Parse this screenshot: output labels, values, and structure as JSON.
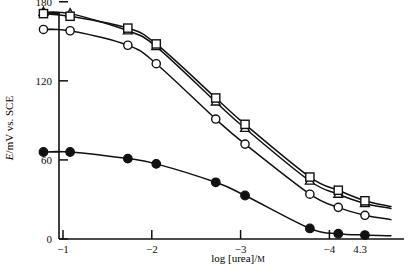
{
  "chart_data": {
    "type": "line",
    "title": "",
    "xlabel": "log [urea]/M",
    "ylabel": "E/mV vs. SCE",
    "xlim": [
      -0.65,
      -4.62
    ],
    "ylim": [
      0,
      195
    ],
    "grid": false,
    "legend": "none",
    "x_ticks": [
      "-1",
      "-2",
      "-3",
      "-4"
    ],
    "x_tick_values": [
      -1,
      -2,
      -3,
      -4
    ],
    "x_extra_tick_label": "4.3",
    "x_extra_tick_value": -4.3,
    "y_ticks": [
      "0",
      "60",
      "120",
      "180"
    ],
    "y_tick_values": [
      0,
      60,
      120,
      180
    ],
    "series": [
      {
        "name": "series-triangles",
        "marker": "open-triangle",
        "x": [
          -0.78,
          -1.08,
          -1.73,
          -2.05,
          -2.72,
          -3.05,
          -3.78,
          -4.1,
          -4.4
        ],
        "y": [
          172,
          171,
          158,
          146,
          104,
          84,
          44,
          34,
          27
        ]
      },
      {
        "name": "series-squares",
        "marker": "open-square",
        "x": [
          -0.78,
          -1.08,
          -1.73,
          -2.05,
          -2.72,
          -3.05,
          -3.78,
          -4.1,
          -4.4
        ],
        "y": [
          171,
          169,
          160,
          148,
          107,
          87,
          47,
          37,
          29
        ]
      },
      {
        "name": "series-open-circles",
        "marker": "open-circle",
        "x": [
          -0.78,
          -1.08,
          -1.73,
          -2.05,
          -2.72,
          -3.05,
          -3.78,
          -4.1,
          -4.4
        ],
        "y": [
          159,
          158,
          147,
          133,
          91,
          72,
          34,
          24,
          18
        ]
      },
      {
        "name": "series-filled-circles",
        "marker": "filled-circle",
        "x": [
          -0.78,
          -1.08,
          -1.73,
          -2.05,
          -2.72,
          -3.05,
          -3.78,
          -4.1,
          -4.4
        ],
        "y": [
          66,
          66,
          61,
          57,
          43,
          33,
          8,
          4,
          3
        ]
      }
    ]
  },
  "axes": {
    "x_title": "log [urea]/M",
    "x_title_main": "log [urea]/",
    "x_title_unit": "M",
    "y_title_sym": "E",
    "y_title_rest": "/mV vs. SCE"
  }
}
